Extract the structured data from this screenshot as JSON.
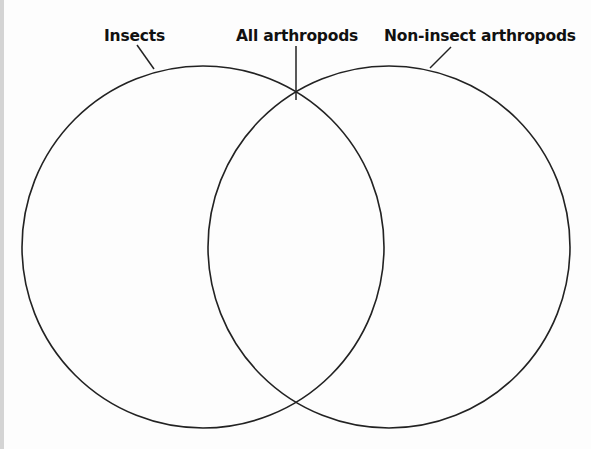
{
  "labels": {
    "left": "Insects",
    "center": "All arthropods",
    "right": "Non-insect arthropods"
  },
  "diagram": {
    "type": "venn",
    "sets": [
      {
        "name": "Insects",
        "cx": 203,
        "cy": 247,
        "r": 181
      },
      {
        "name": "Non-insect arthropods",
        "cx": 389,
        "cy": 247,
        "r": 181
      }
    ],
    "intersection_label": "All arthropods",
    "stroke_color": "#222222",
    "background_color": "#fdfdfd"
  }
}
